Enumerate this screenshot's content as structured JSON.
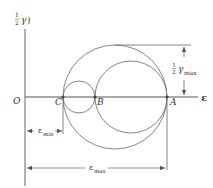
{
  "diagram": {
    "axes": {
      "y_label_frac": "1/2",
      "y_label_num": "1",
      "y_label_den": "2",
      "y_label_symbol": "γ",
      "y_label_tail": ")",
      "x_label": "ε",
      "origin_label": "O"
    },
    "points": [
      {
        "label": "C"
      },
      {
        "label": "B"
      },
      {
        "label": "A"
      }
    ],
    "dimensions": {
      "gamma_max": {
        "num": "1",
        "den": "2",
        "symbol": "γ",
        "sub": "max"
      },
      "eps_min": {
        "symbol": "ε",
        "sub": "min"
      },
      "eps_max": {
        "symbol": "ε",
        "sub": "max"
      }
    },
    "colors": {
      "line": "#555555",
      "text": "#333333",
      "background": "#ffffff"
    }
  }
}
